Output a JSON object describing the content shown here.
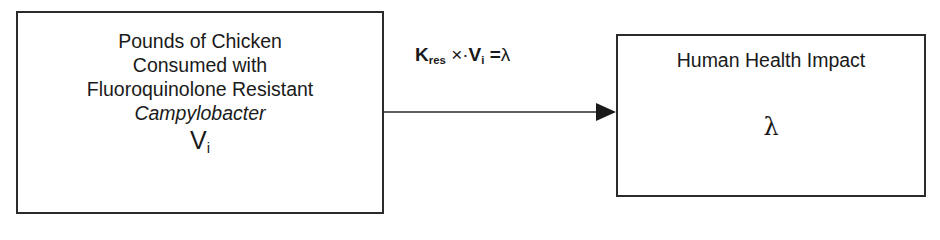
{
  "diagram": {
    "source_box": {
      "lines": [
        "Pounds of Chicken",
        "Consumed with",
        "Fluoroquinolone Resistant"
      ],
      "italic_line": "Campylobacter",
      "variable": {
        "base": "V",
        "subscript": "i"
      }
    },
    "arrow": {
      "formula": {
        "k_base": "K",
        "k_subscript": "res",
        "operator": "×·",
        "v_base": "V",
        "v_subscript": "i",
        "equals": "=",
        "result": "λ"
      }
    },
    "target_box": {
      "title": "Human Health Impact",
      "variable": "λ"
    },
    "colors": {
      "stroke": "#2b2b2b",
      "text": "#1a1a1a",
      "background": "#ffffff"
    }
  }
}
